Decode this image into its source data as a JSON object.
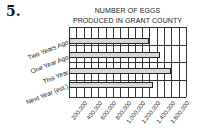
{
  "question_number": "5.",
  "title_line1": "NUMBER OF EGGS",
  "title_line2": "PRODUCED IN GRANT COUNTY",
  "colors": {
    "bar_fill": "#d6d6d6",
    "bar_outline": "#222222",
    "grid": "#333333"
  },
  "categories": [
    "Two Years Ago",
    "One Year Ago",
    "This Year",
    "Next Year (est.)"
  ],
  "ticks": [
    "200,000",
    "400,000",
    "600,000",
    "800,000",
    "1,000,000",
    "1,200,000",
    "1,400,000",
    "1,600,000"
  ],
  "chart_data": {
    "type": "bar",
    "orientation": "horizontal",
    "categories": [
      "Two Years Ago",
      "One Year Ago",
      "This Year",
      "Next Year (est.)"
    ],
    "values": [
      1100000,
      1250000,
      1400000,
      1150000
    ],
    "xlabel": "",
    "ylabel": "",
    "xlim": [
      0,
      1600000
    ],
    "x_tick_labels": [
      "200,000",
      "400,000",
      "600,000",
      "800,000",
      "1,000,000",
      "1,200,000",
      "1,400,000",
      "1,600,000"
    ],
    "grid": "vertical lines every 100,000",
    "legend": "none"
  }
}
